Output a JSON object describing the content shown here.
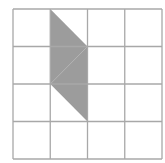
{
  "diagram": {
    "type": "grid-shading",
    "grid": {
      "rows": 4,
      "cols": 4,
      "x0": 13,
      "y0": 9,
      "cell_w": 37.25,
      "cell_h": 37.5,
      "line_color": "#a8a8a8"
    },
    "shape": {
      "name": "parallelogram",
      "fill": "#9c9c9c",
      "points_units": [
        [
          1,
          0
        ],
        [
          2,
          1
        ],
        [
          2,
          3
        ],
        [
          1,
          2
        ]
      ],
      "internal_diagonal_units": [
        [
          1,
          2
        ],
        [
          2,
          1
        ]
      ]
    }
  }
}
